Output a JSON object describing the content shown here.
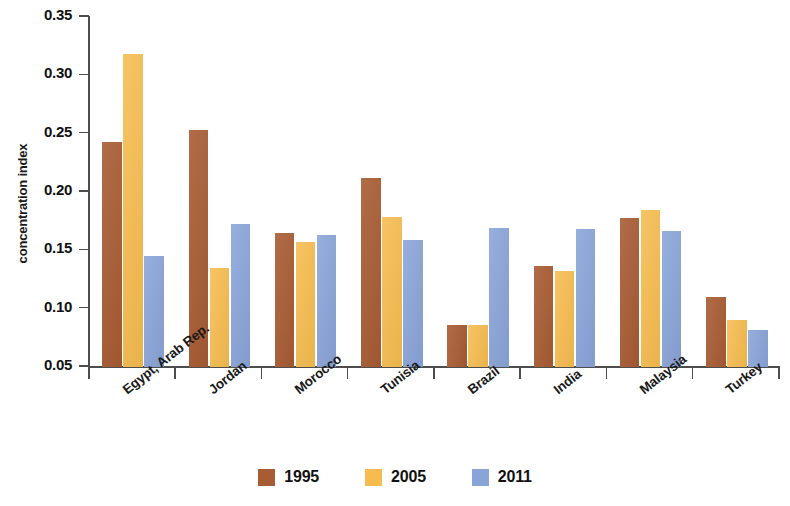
{
  "chart_data": {
    "type": "bar",
    "title": "",
    "xlabel": "",
    "ylabel": "concentration index",
    "ylim": [
      0.05,
      0.35
    ],
    "ytick_labels": [
      "0.35",
      "0.30",
      "0.25",
      "0.20",
      "0.15",
      "0.10",
      "0.05"
    ],
    "ytick_values": [
      0.35,
      0.3,
      0.25,
      0.2,
      0.15,
      0.1,
      0.05
    ],
    "grid": false,
    "legend_position": "bottom-center",
    "categories": [
      "Egypt, Arab Rep.",
      "Jordan",
      "Morocco",
      "Tunisia",
      "Brazil",
      "India",
      "Malaysia",
      "Turkey"
    ],
    "series": [
      {
        "name": "1995",
        "color": "#a85c33",
        "values": [
          0.243,
          0.253,
          0.165,
          0.212,
          0.086,
          0.137,
          0.178,
          0.11
        ]
      },
      {
        "name": "2005",
        "color": "#f6bc4f",
        "values": [
          0.318,
          0.135,
          0.157,
          0.179,
          0.086,
          0.132,
          0.185,
          0.09
        ]
      },
      {
        "name": "2011",
        "color": "#89a4d8",
        "values": [
          0.145,
          0.173,
          0.163,
          0.159,
          0.169,
          0.168,
          0.167,
          0.082
        ]
      }
    ]
  },
  "legend": {
    "entries": [
      {
        "label": "1995",
        "series_key": "s1995"
      },
      {
        "label": "2005",
        "series_key": "s2005"
      },
      {
        "label": "2011",
        "series_key": "s2011"
      }
    ]
  },
  "axis": {
    "y_title": "concentration index"
  }
}
